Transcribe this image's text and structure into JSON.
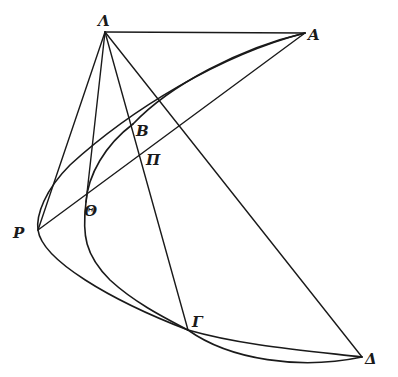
{
  "diagram": {
    "type": "geometric-figure",
    "stroke_color": "#1a1a1a",
    "background": "#ffffff",
    "points": {
      "Lambda": {
        "label": "Λ",
        "x": 105,
        "y": 32
      },
      "A": {
        "label": "A",
        "x": 305,
        "y": 33
      },
      "B": {
        "label": "B",
        "x": 133,
        "y": 124
      },
      "Pi": {
        "label": "Π",
        "x": 145,
        "y": 153
      },
      "Theta": {
        "label": "Θ",
        "x": 86,
        "y": 202
      },
      "P": {
        "label": "P",
        "x": 38,
        "y": 230
      },
      "Gamma": {
        "label": "Γ",
        "x": 188,
        "y": 330
      },
      "Delta": {
        "label": "Δ",
        "x": 362,
        "y": 357
      }
    },
    "labels": {
      "lambda": "Λ",
      "a": "A",
      "b": "B",
      "pi": "Π",
      "theta": "Θ",
      "p": "P",
      "gamma": "Γ",
      "delta": "Δ"
    },
    "segments": [
      [
        "Lambda",
        "A"
      ],
      [
        "Lambda",
        "P"
      ],
      [
        "Lambda",
        "Theta"
      ],
      [
        "Lambda",
        "Gamma"
      ],
      [
        "Lambda",
        "Delta"
      ],
      [
        "P",
        "A"
      ]
    ],
    "curves": [
      "outer arc A–P–Γ–Δ",
      "inner arc A–B–Θ–Γ",
      "arc Γ–Δ (lower)"
    ]
  }
}
